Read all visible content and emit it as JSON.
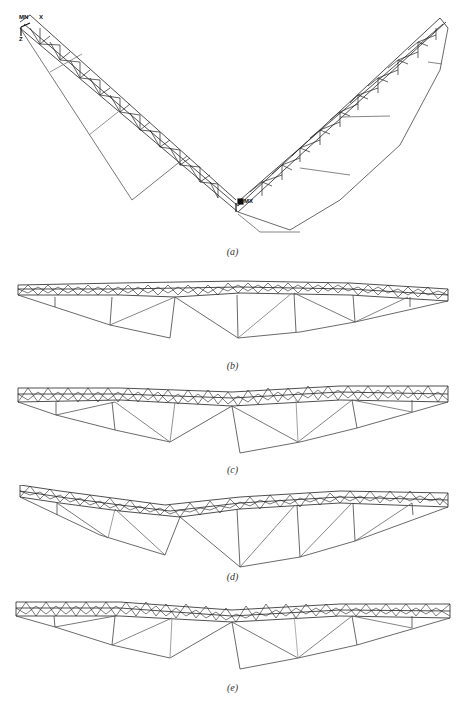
{
  "figure": {
    "panels": [
      {
        "id": "a",
        "caption": "(a)",
        "description": "V-shaped deformed truss mode shape"
      },
      {
        "id": "b",
        "caption": "(b)",
        "description": "Horizontal truss mode shape with mid-left hanging kink"
      },
      {
        "id": "c",
        "caption": "(c)",
        "description": "Horizontal truss mode shape with center hanging kink"
      },
      {
        "id": "d",
        "caption": "(d)",
        "description": "Curved truss mode shape with mid-left hanging kink"
      },
      {
        "id": "e",
        "caption": "(e)",
        "description": "Horizontal truss mode shape with center hanging kink"
      }
    ],
    "triad_labels": {
      "mn": "MN",
      "x": "X",
      "y": "Y",
      "z": "Z",
      "mx": "MX"
    },
    "colors": {
      "line": "#222222",
      "light_line": "#9a9a9a",
      "background": "#ffffff"
    }
  }
}
